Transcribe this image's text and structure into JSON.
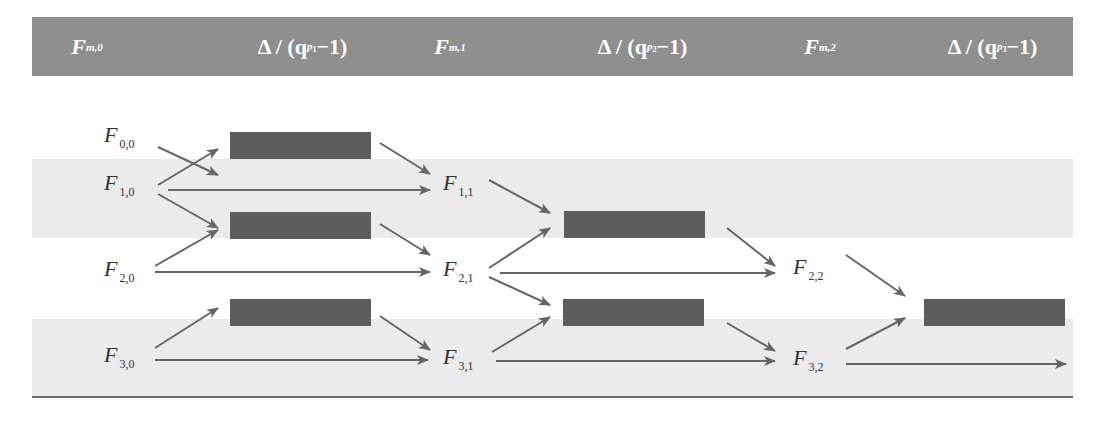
{
  "diagram": {
    "header": {
      "columns": [
        {
          "id": "fm0",
          "symbol": "F",
          "sub": "m,0"
        },
        {
          "id": "delta1",
          "prefix": "Δ / (q",
          "exp_base": "p",
          "exp_sub": "1",
          "suffix": "−1)"
        },
        {
          "id": "fm1",
          "symbol": "F",
          "sub": "m,1"
        },
        {
          "id": "delta2",
          "prefix": "Δ / (q",
          "exp_base": "p",
          "exp_sub": "2",
          "suffix": "−1)"
        },
        {
          "id": "fm2",
          "symbol": "F",
          "sub": "m,2"
        },
        {
          "id": "delta3",
          "prefix": "Δ / (q",
          "exp_base": "p",
          "exp_sub": "3",
          "suffix": "−1)"
        }
      ]
    },
    "nodes": [
      {
        "id": "F00",
        "symbol": "F",
        "sub": "0,0"
      },
      {
        "id": "F10",
        "symbol": "F",
        "sub": "1,0"
      },
      {
        "id": "F20",
        "symbol": "F",
        "sub": "2,0"
      },
      {
        "id": "F30",
        "symbol": "F",
        "sub": "3,0"
      },
      {
        "id": "F11",
        "symbol": "F",
        "sub": "1,1"
      },
      {
        "id": "F21",
        "symbol": "F",
        "sub": "2,1"
      },
      {
        "id": "F31",
        "symbol": "F",
        "sub": "3,1"
      },
      {
        "id": "F22",
        "symbol": "F",
        "sub": "2,2"
      },
      {
        "id": "F32",
        "symbol": "F",
        "sub": "3,2"
      }
    ],
    "boxes": [
      {
        "id": "box-1a",
        "column": "delta1",
        "inputs": [
          "F00",
          "F10"
        ],
        "output": "F11"
      },
      {
        "id": "box-1b",
        "column": "delta1",
        "inputs": [
          "F10",
          "F20"
        ],
        "output": "F21"
      },
      {
        "id": "box-1c",
        "column": "delta1",
        "inputs": [
          "F30"
        ],
        "output": "F31"
      },
      {
        "id": "box-2a",
        "column": "delta2",
        "inputs": [
          "F11",
          "F21"
        ],
        "output": "F22"
      },
      {
        "id": "box-2b",
        "column": "delta2",
        "inputs": [
          "F21",
          "F31"
        ],
        "output": "F32"
      },
      {
        "id": "box-3a",
        "column": "delta3",
        "inputs": [
          "F22",
          "F32"
        ],
        "output": null
      }
    ],
    "passthrough_edges": [
      [
        "F10",
        "F11"
      ],
      [
        "F20",
        "F21"
      ],
      [
        "F30",
        "F31"
      ],
      [
        "F21",
        "F22"
      ],
      [
        "F31",
        "F32"
      ],
      [
        "F32",
        "out"
      ]
    ],
    "colors": {
      "header_bg": "#8f8f8f",
      "header_text": "#ffffff",
      "band_bg": "#ebebeb",
      "box_fill": "#5d5d5d",
      "arrow": "#666666",
      "rule": "#6a6a6a"
    }
  }
}
